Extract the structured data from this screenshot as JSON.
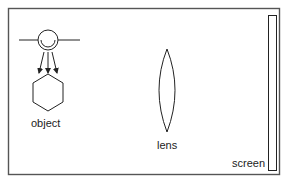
{
  "diagram": {
    "title": "",
    "labels": {
      "object": "object",
      "lens": "lens",
      "screen": "screen"
    },
    "components": [
      {
        "id": "light-source",
        "type": "lamp-with-reflector"
      },
      {
        "id": "light-rays",
        "type": "arrows",
        "count": 3
      },
      {
        "id": "object",
        "type": "hexagon"
      },
      {
        "id": "lens",
        "type": "convex-lens"
      },
      {
        "id": "screen",
        "type": "vertical-rectangle"
      }
    ],
    "colors": {
      "frame": "#555555",
      "stroke": "#222222",
      "background": "#ffffff"
    }
  }
}
